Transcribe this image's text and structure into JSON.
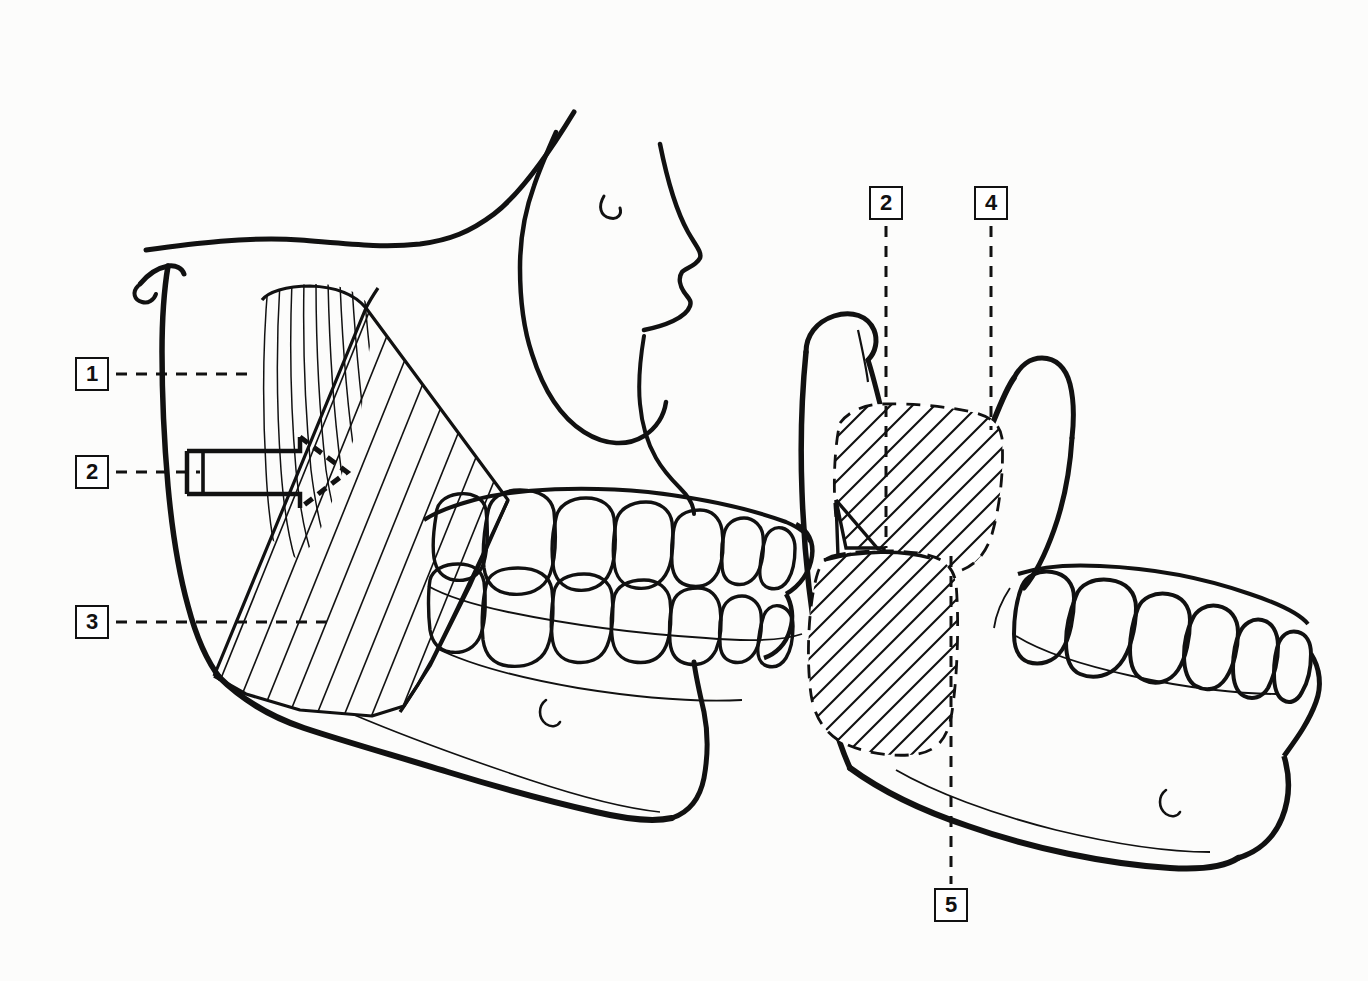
{
  "figure": {
    "background_color": "#fcfcfb",
    "line_color": "#111111",
    "panels": [
      {
        "name": "lateral-skull-view",
        "description": "Lateral view of skull and mandible with masseter muscle shown in place, fibre striations drawn"
      },
      {
        "name": "mandible-attachment-view",
        "description": "Isolated mandible showing hatched attachment areas of the superficial and deep masseter"
      }
    ]
  },
  "labels": [
    {
      "id": "label-1",
      "text": "1",
      "box": {
        "x": 75,
        "y": 357
      },
      "leader": "dashed-horizontal"
    },
    {
      "id": "label-2-left",
      "text": "2",
      "box": {
        "x": 75,
        "y": 455
      },
      "leader": "dashed-horizontal"
    },
    {
      "id": "label-3",
      "text": "3",
      "box": {
        "x": 75,
        "y": 605
      },
      "leader": "dashed-horizontal"
    },
    {
      "id": "label-2-right",
      "text": "2",
      "box": {
        "x": 869,
        "y": 186
      },
      "leader": "dashed-vertical"
    },
    {
      "id": "label-4",
      "text": "4",
      "box": {
        "x": 974,
        "y": 186
      },
      "leader": "dashed-vertical"
    },
    {
      "id": "label-5",
      "text": "5",
      "box": {
        "x": 934,
        "y": 888
      },
      "leader": "dashed-vertical"
    }
  ],
  "annotations": {
    "arrow": {
      "name": "force-direction-arrow",
      "style": "solid outline with dashed arrowhead",
      "points_to": "masseter muscle fibres"
    }
  }
}
